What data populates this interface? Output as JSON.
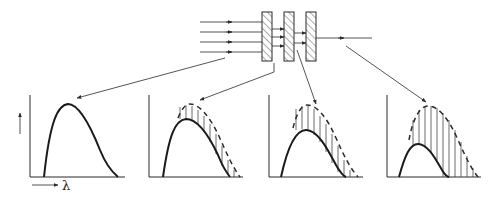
{
  "diagram": {
    "colors": {
      "ink": "#2a2a2a",
      "background": "#ffffff"
    },
    "beam": {
      "incoming_rays": 4,
      "after_plate_1_rays": 3,
      "after_plate_2_rays": 2,
      "after_plate_3_rays": 1
    },
    "plates": [
      {
        "id": "plate-1"
      },
      {
        "id": "plate-2"
      },
      {
        "id": "plate-3"
      }
    ],
    "axes": {
      "x_label": "λ",
      "y_label": "I"
    },
    "panels": [
      {
        "id": "panel-incident",
        "solid_peak_scale": 1.0,
        "dashed_reference": false,
        "source": "incoming beam"
      },
      {
        "id": "panel-after-plate-1",
        "solid_peak_scale": 0.85,
        "dashed_reference": true,
        "source": "after plate 1"
      },
      {
        "id": "panel-after-plate-2",
        "solid_peak_scale": 0.7,
        "dashed_reference": true,
        "source": "after plate 2"
      },
      {
        "id": "panel-after-plate-3",
        "solid_peak_scale": 0.45,
        "dashed_reference": true,
        "source": "after plate 3"
      }
    ]
  }
}
